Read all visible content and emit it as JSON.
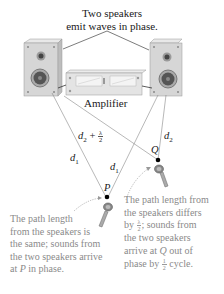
{
  "figure": {
    "top_caption_line1": "Two speakers",
    "top_caption_line2": "emit waves in phase.",
    "amplifier_label": "Amplifier",
    "labels": {
      "d2_plus_half_lambda_d": "d",
      "d2_plus_half_lambda_sub": "2",
      "d2_plus_half_lambda_plus": " + ",
      "lambda": "λ",
      "two": "2",
      "d1_left": "d",
      "d1_left_sub": "1",
      "d1_right": "d",
      "d1_right_sub": "1",
      "d2_right": "d",
      "d2_right_sub": "2",
      "point_p": "P",
      "point_q": "Q"
    },
    "note_p": {
      "line1": "The path length",
      "line2": "from the speakers is",
      "line3": "the same; sounds from",
      "line4": "the two speakers arrive",
      "line5_pre": "at ",
      "line5_var": "P",
      "line5_post": " in phase."
    },
    "note_q": {
      "line1": "The path length from",
      "line2": "the speakers differs",
      "line3_pre": "by ",
      "line3_num": "λ",
      "line3_den": "2",
      "line3_post": "; sounds from",
      "line4": "the two speakers",
      "line5_pre": "arrive at ",
      "line5_var": "Q",
      "line5_post": " out of",
      "line6_pre": "phase by ",
      "line6_num": "1",
      "line6_den": "2",
      "line6_post": " cycle."
    },
    "colors": {
      "speaker_body": "#cfcfcf",
      "speaker_front": "#e2e2e2",
      "woofer": "#555555",
      "lines": "#777777",
      "note_text": "#8a8a8a",
      "arrow": "#9a9a9a"
    }
  }
}
